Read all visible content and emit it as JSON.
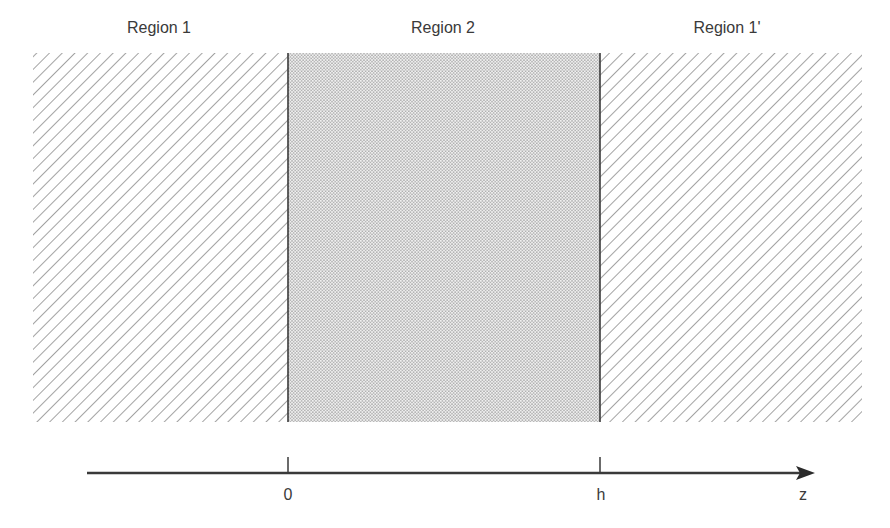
{
  "regions": [
    {
      "label": "Region 1",
      "fill": "hatched",
      "x0": 33,
      "x1": 288
    },
    {
      "label": "Region 2",
      "fill": "dotted",
      "x0": 288,
      "x1": 600
    },
    {
      "label": "Region 1'",
      "fill": "hatched",
      "x0": 600,
      "x1": 862
    }
  ],
  "axis": {
    "variable": "z",
    "ticks": [
      {
        "label": "0",
        "x": 288
      },
      {
        "label": "h",
        "x": 600
      }
    ]
  },
  "colors": {
    "line": "#3a3a3a",
    "hatch": "#555555",
    "dots": "#8a8a8a"
  }
}
